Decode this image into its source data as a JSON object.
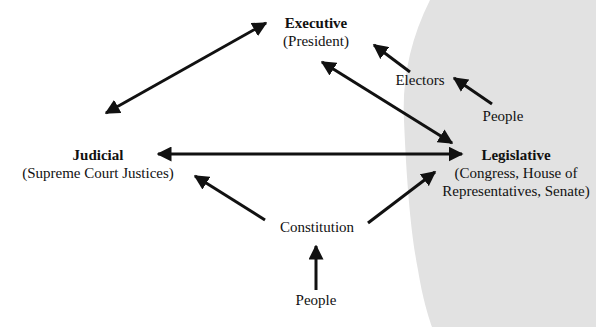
{
  "colors": {
    "background": "#ffffff",
    "shaded_region": "#e2e2e2",
    "ink": "#111111"
  },
  "nodes": {
    "executive": {
      "title": "Executive",
      "subtitle": "(President)"
    },
    "judicial": {
      "title": "Judicial",
      "subtitle": "(Supreme Court Justices)"
    },
    "legislative": {
      "title": "Legislative",
      "subtitle_line1": "(Congress, House of",
      "subtitle_line2": "Representatives, Senate)"
    },
    "electors": {
      "label": "Electors"
    },
    "people_top": {
      "label": "People"
    },
    "constitution": {
      "label": "Constitution"
    },
    "people_bottom": {
      "label": "People"
    }
  },
  "edges": [
    {
      "from": "judicial",
      "to": "executive",
      "type": "double-arrow"
    },
    {
      "from": "executive",
      "to": "legislative",
      "type": "double-arrow"
    },
    {
      "from": "judicial",
      "to": "legislative",
      "type": "double-arrow"
    },
    {
      "from": "electors",
      "to": "executive",
      "type": "arrow"
    },
    {
      "from": "people_top",
      "to": "electors",
      "type": "arrow"
    },
    {
      "from": "constitution",
      "to": "judicial",
      "type": "arrow"
    },
    {
      "from": "constitution",
      "to": "legislative",
      "type": "arrow"
    },
    {
      "from": "people_bottom",
      "to": "constitution",
      "type": "arrow"
    }
  ]
}
